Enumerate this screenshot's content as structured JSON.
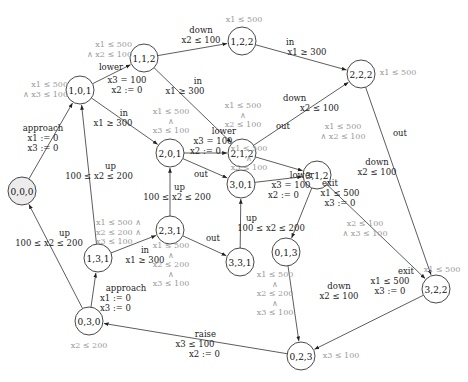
{
  "diagram": {
    "type": "timed-automaton-state-graph",
    "initial_node": "0,0,0",
    "nodes": [
      {
        "id": "0,0,0",
        "label": "0,0,0",
        "x": 22,
        "y": 191,
        "initial": true
      },
      {
        "id": "1,0,1",
        "label": "1,0,1",
        "x": 80,
        "y": 90
      },
      {
        "id": "1,1,2",
        "label": "1,1,2",
        "x": 144,
        "y": 58
      },
      {
        "id": "1,2,2",
        "label": "1,2,2",
        "x": 242,
        "y": 41
      },
      {
        "id": "2,2,2",
        "label": "2,2,2",
        "x": 361,
        "y": 74
      },
      {
        "id": "2,1,2",
        "label": "2,1,2",
        "x": 242,
        "y": 153
      },
      {
        "id": "2,0,1",
        "label": "2,0,1",
        "x": 170,
        "y": 153
      },
      {
        "id": "3,0,1",
        "label": "3,0,1",
        "x": 241,
        "y": 184
      },
      {
        "id": "3,1,2",
        "label": "3,1,2",
        "x": 317,
        "y": 175
      },
      {
        "id": "3,2,2",
        "label": "3,2,2",
        "x": 436,
        "y": 289
      },
      {
        "id": "0,1,3",
        "label": "0,1,3",
        "x": 286,
        "y": 252
      },
      {
        "id": "2,3,1",
        "label": "2,3,1",
        "x": 170,
        "y": 230
      },
      {
        "id": "3,3,1",
        "label": "3,3,1",
        "x": 240,
        "y": 262
      },
      {
        "id": "1,3,1",
        "label": "1,3,1",
        "x": 98,
        "y": 258
      },
      {
        "id": "0,3,0",
        "label": "0,3,0",
        "x": 89,
        "y": 321
      },
      {
        "id": "0,2,3",
        "label": "0,2,3",
        "x": 301,
        "y": 356
      }
    ],
    "invariants": {
      "1,0,1": [
        "x1 ≤ 500",
        "∧ x3 ≤ 100"
      ],
      "1,1,2": [
        "x1 ≤ 500",
        "∧ x2 ≤ 100"
      ],
      "1,2,2": [
        "x1 ≤ 500"
      ],
      "2,2,2": [
        "x1 ≤ 500"
      ],
      "2,1,2": [
        "x1 ≤ 500",
        "∧",
        "x2 ≤ 100"
      ],
      "2,0,1": [
        "x1 ≤ 500",
        "∧",
        "x3 ≤ 100"
      ],
      "3,0,1": [
        "x1 ≤ 500",
        "∧",
        "x3 ≤ 100"
      ],
      "3,1,2": [
        "x1 ≤ 500",
        "∧ x2 ≤ 100"
      ],
      "3,2,2": [
        "x1 ≤ 500"
      ],
      "0,1,3": [
        "x2 ≤ 100",
        "∧ x3 ≤ 100"
      ],
      "1,3,1": [
        "x1 ≤ 500 ∧",
        "x2 ≤ 200 ∧",
        "x3 ≤ 100"
      ],
      "2,3,1": [
        "x1 ≤ 500",
        "∧",
        "x2 ≤ 200",
        "∧",
        "x3 ≤ 100"
      ],
      "3,3,1": [
        "x1 ≤ 500",
        "∧",
        "x2 ≤ 200",
        "∧",
        "x3 ≤ 100"
      ],
      "0,3,0": [
        "x2 ≤ 200"
      ],
      "0,2,3": [
        "x3 ≤ 100"
      ]
    },
    "edges": [
      {
        "from": "0,0,0",
        "to": "1,0,1",
        "label": [
          "approach",
          "x1 := 0",
          "x3 := 0"
        ]
      },
      {
        "from": "1,0,1",
        "to": "1,1,2",
        "label": [
          "lower",
          "x3 = 100",
          "x2 := 0"
        ]
      },
      {
        "from": "1,0,1",
        "to": "2,0,1",
        "label": [
          "in",
          "x1 ≥ 300"
        ]
      },
      {
        "from": "1,1,2",
        "to": "1,2,2",
        "label": [
          "down",
          "x2 ≤ 100"
        ]
      },
      {
        "from": "1,1,2",
        "to": "2,1,2",
        "label": [
          "in",
          "x1 ≥ 300"
        ]
      },
      {
        "from": "1,2,2",
        "to": "2,2,2",
        "label": [
          "in",
          "x1 ≥ 300"
        ]
      },
      {
        "from": "2,1,2",
        "to": "2,2,2",
        "label": [
          "down",
          "x2 ≤ 100"
        ]
      },
      {
        "from": "2,0,1",
        "to": "2,1,2",
        "label": [
          "lower",
          "x3 = 100",
          "x2 := 0"
        ]
      },
      {
        "from": "2,0,1",
        "to": "3,0,1",
        "label": [
          "out"
        ]
      },
      {
        "from": "2,1,2",
        "to": "3,1,2",
        "label": [
          "out"
        ]
      },
      {
        "from": "3,0,1",
        "to": "3,1,2",
        "label": [
          "lower",
          "x3 = 100",
          "x2 := 0"
        ]
      },
      {
        "from": "2,2,2",
        "to": "3,2,2",
        "label": [
          "out"
        ]
      },
      {
        "from": "3,1,2",
        "to": "3,2,2",
        "label": [
          "down",
          "x2 ≤ 100"
        ]
      },
      {
        "from": "3,1,2",
        "to": "0,1,3",
        "label": [
          "exit",
          "x1 ≤ 500",
          "x3 := 0"
        ]
      },
      {
        "from": "3,2,2",
        "to": "0,2,3",
        "label": [
          "exit",
          "x1 ≤ 500",
          "x3 := 0"
        ]
      },
      {
        "from": "0,1,3",
        "to": "0,2,3",
        "label": [
          "down",
          "x2 ≤ 100"
        ]
      },
      {
        "from": "0,2,3",
        "to": "0,3,0",
        "label": [
          "raise",
          "x3 ≤ 100",
          "x2 := 0"
        ]
      },
      {
        "from": "0,3,0",
        "to": "0,0,0",
        "label": [
          "up",
          "100 ≤ x2 ≤ 200"
        ]
      },
      {
        "from": "0,3,0",
        "to": "1,3,1",
        "label": [
          "approach",
          "x1 := 0",
          "x3 := 0"
        ]
      },
      {
        "from": "1,3,1",
        "to": "1,0,1",
        "label": [
          "up",
          "100 ≤ x2 ≤ 200"
        ]
      },
      {
        "from": "1,3,1",
        "to": "2,3,1",
        "label": [
          "in",
          "x1 ≥ 300"
        ]
      },
      {
        "from": "2,3,1",
        "to": "2,0,1",
        "label": [
          "up",
          "100 ≤ x2 ≤ 200"
        ]
      },
      {
        "from": "2,3,1",
        "to": "3,3,1",
        "label": [
          "out"
        ]
      },
      {
        "from": "3,3,1",
        "to": "3,0,1",
        "label": [
          "up",
          "100 ≤ x2 ≤ 200"
        ]
      }
    ]
  }
}
